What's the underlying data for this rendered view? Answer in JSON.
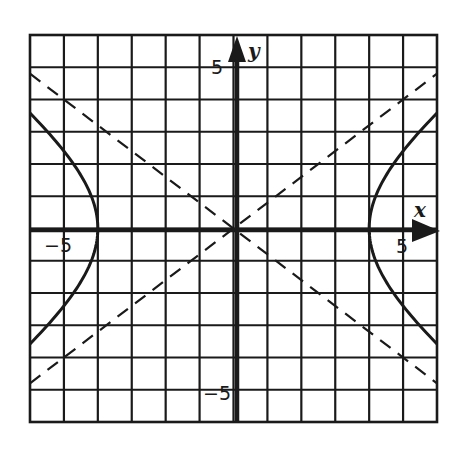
{
  "chart_data": {
    "type": "line",
    "title": "",
    "xlabel": "x",
    "ylabel": "y",
    "xlim": [
      -6,
      6
    ],
    "ylim": [
      -6,
      6
    ],
    "grid": true,
    "grid_step": 1,
    "tick_labels": {
      "x": [
        {
          "value": -5,
          "label": "-5"
        },
        {
          "value": 5,
          "label": "5"
        }
      ],
      "y": [
        {
          "value": 5,
          "label": "5"
        },
        {
          "value": -5,
          "label": "-5"
        }
      ]
    },
    "series": [
      {
        "name": "hyperbola (x^2/16 - y^2/10.24 = 1)",
        "style": "solid",
        "a": 4,
        "b": 3.2,
        "vertices": [
          [
            -4,
            0
          ],
          [
            4,
            0
          ]
        ]
      },
      {
        "name": "asymptote y = 0.8x",
        "style": "dashed",
        "slope": 0.8,
        "points": [
          [
            -6,
            -4.8
          ],
          [
            0,
            0
          ],
          [
            5,
            4
          ],
          [
            6,
            4.8
          ]
        ]
      },
      {
        "name": "asymptote y = -0.8x",
        "style": "dashed",
        "slope": -0.8,
        "points": [
          [
            -6,
            4.8
          ],
          [
            0,
            0
          ],
          [
            5,
            -4
          ],
          [
            6,
            -4.8
          ]
        ]
      }
    ],
    "legend": null
  },
  "labels": {
    "x_axis": "x",
    "y_axis": "y",
    "x_neg5": "-5",
    "x_pos5": "5",
    "y_pos5": "5",
    "y_neg5": "-5"
  },
  "colors": {
    "ink": "#1a1a1a",
    "background": "#ffffff"
  }
}
